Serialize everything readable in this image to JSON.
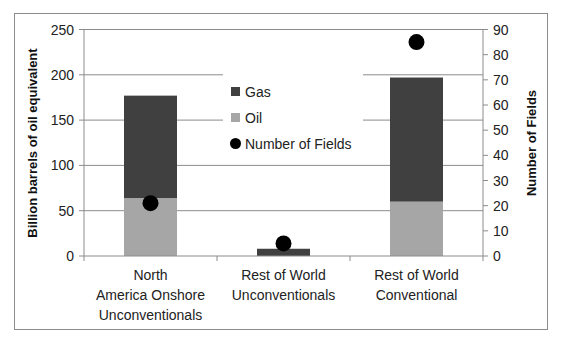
{
  "chart_data": {
    "type": "bar",
    "subtype": "stacked bar with scatter on secondary axis",
    "title": "",
    "categories": [
      [
        "North",
        "America Onshore",
        "Unconventionals"
      ],
      [
        "Rest of World",
        "Unconventionals"
      ],
      [
        "Rest of World",
        "Conventional"
      ]
    ],
    "series": [
      {
        "name": "Oil",
        "type": "bar",
        "axis": "left",
        "color": "#a6a6a6",
        "values": [
          64,
          0,
          60
        ]
      },
      {
        "name": "Gas",
        "type": "bar",
        "axis": "left",
        "color": "#404040",
        "values": [
          113,
          8,
          137
        ]
      },
      {
        "name": "Number of Fields",
        "type": "scatter",
        "axis": "right",
        "color": "#000000",
        "values": [
          21,
          5,
          85
        ]
      }
    ],
    "ylabel": "Billion barrels of oil equivalent",
    "ylim": [
      0,
      250
    ],
    "yticks": [
      0,
      50,
      100,
      150,
      200,
      250
    ],
    "y2label": "Number of Fields",
    "y2lim": [
      0,
      90
    ],
    "y2ticks": [
      0,
      10,
      20,
      30,
      40,
      50,
      60,
      70,
      80,
      90
    ],
    "grid": true,
    "legend": {
      "position": "inside-center-top",
      "entries": [
        {
          "label": "Gas",
          "marker": "square",
          "color": "#404040"
        },
        {
          "label": "Oil",
          "marker": "square",
          "color": "#a6a6a6"
        },
        {
          "label": "Number of Fields",
          "marker": "circle",
          "color": "#000000"
        }
      ]
    }
  }
}
